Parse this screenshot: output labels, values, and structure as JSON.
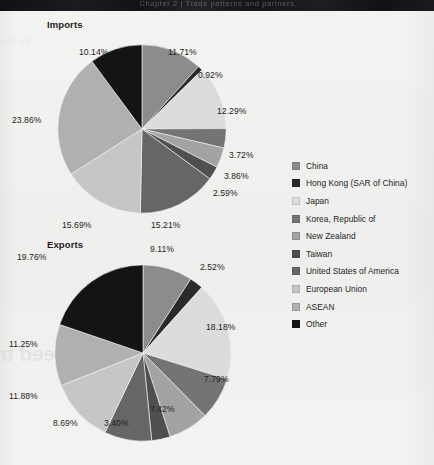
{
  "header": {
    "bar_text": "Chapter 2  |  Trade patterns and partners"
  },
  "bleed_through": {
    "headline": "Why nations need tr",
    "line": "the structure of merchandise trade by partner economy"
  },
  "legend": {
    "items": [
      {
        "label": "China",
        "color": "#8c8c8c"
      },
      {
        "label": "Hong Kong (SAR of China)",
        "color": "#2a2a2a"
      },
      {
        "label": "Japan",
        "color": "#dcdcdc"
      },
      {
        "label": "Korea, Republic of",
        "color": "#747474"
      },
      {
        "label": "New Zealand",
        "color": "#a3a3a3"
      },
      {
        "label": "Taiwan",
        "color": "#4f4f4f"
      },
      {
        "label": "United States of America",
        "color": "#666666"
      },
      {
        "label": "European Union",
        "color": "#c6c6c6"
      },
      {
        "label": "ASEAN",
        "color": "#b0b0b0"
      },
      {
        "label": "Other",
        "color": "#141414"
      }
    ]
  },
  "chart_data": [
    {
      "type": "pie",
      "title": "Imports",
      "xlabel": "",
      "ylabel": "",
      "legend_position": "right",
      "grid": false,
      "categories": [
        "China",
        "Hong Kong (SAR of China)",
        "Japan",
        "Korea, Republic of",
        "New Zealand",
        "Taiwan",
        "United States of America",
        "European Union",
        "ASEAN",
        "Other"
      ],
      "values": [
        11.71,
        0.92,
        12.29,
        3.72,
        3.86,
        2.59,
        15.21,
        15.69,
        23.86,
        10.14
      ],
      "colors": [
        "#8c8c8c",
        "#2a2a2a",
        "#dcdcdc",
        "#747474",
        "#a3a3a3",
        "#4f4f4f",
        "#666666",
        "#c6c6c6",
        "#b0b0b0",
        "#141414"
      ],
      "labels": [
        "11.71%",
        "0.92%",
        "12.29%",
        "3.72%",
        "3.86%",
        "2.59%",
        "15.21%",
        "15.69%",
        "23.86%",
        "10.14%"
      ],
      "label_positions": [
        {
          "left": 168,
          "top": 36
        },
        {
          "left": 198,
          "top": 59
        },
        {
          "left": 217,
          "top": 95
        },
        {
          "left": 229,
          "top": 139
        },
        {
          "left": 224,
          "top": 160
        },
        {
          "left": 213,
          "top": 177
        },
        {
          "left": 151,
          "top": 209
        },
        {
          "left": 62,
          "top": 209
        },
        {
          "left": 12,
          "top": 104
        },
        {
          "left": 79,
          "top": 36
        }
      ],
      "total": 99.99
    },
    {
      "type": "pie",
      "title": "Exports",
      "xlabel": "",
      "ylabel": "",
      "legend_position": "right",
      "grid": false,
      "categories": [
        "China",
        "Hong Kong (SAR of China)",
        "Japan",
        "Korea, Republic of",
        "New Zealand",
        "Taiwan",
        "United States of America",
        "European Union",
        "ASEAN",
        "Other"
      ],
      "values": [
        9.11,
        2.52,
        18.18,
        7.79,
        7.42,
        3.4,
        8.69,
        11.88,
        11.25,
        19.76
      ],
      "colors": [
        "#8c8c8c",
        "#2a2a2a",
        "#dcdcdc",
        "#747474",
        "#a3a3a3",
        "#4f4f4f",
        "#666666",
        "#c6c6c6",
        "#b0b0b0",
        "#141414"
      ],
      "labels": [
        "9.11%",
        "2.52%",
        "18.18%",
        "7.79%",
        "7.42%",
        "3.40%",
        "8.69%",
        "11.88%",
        "11.25%",
        "19.76%"
      ],
      "label_positions": [
        {
          "left": 150,
          "top": 8
        },
        {
          "left": 200,
          "top": 26
        },
        {
          "left": 206,
          "top": 86
        },
        {
          "left": 204,
          "top": 138
        },
        {
          "left": 150,
          "top": 168
        },
        {
          "left": 104,
          "top": 182
        },
        {
          "left": 53,
          "top": 182
        },
        {
          "left": 9,
          "top": 155
        },
        {
          "left": 9,
          "top": 103
        },
        {
          "left": 17,
          "top": 16
        }
      ],
      "total": 100.0
    }
  ]
}
